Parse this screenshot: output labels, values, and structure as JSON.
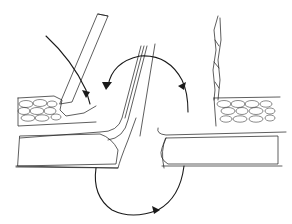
{
  "figure": {
    "type": "anatomical line illustration",
    "colors": {
      "background": "#ffffff",
      "ink": "#1a1a1a",
      "hatch": "#6a6a6a"
    },
    "elements": [
      {
        "name": "left-elevated-flap",
        "description": "diagonal textured flap rising from left tissue"
      },
      {
        "name": "right-vertical-flap",
        "description": "thin vertical flap on right side"
      },
      {
        "name": "left-upper-layer",
        "description": "cobblestone cell layer, left"
      },
      {
        "name": "right-upper-layer",
        "description": "cobblestone cell layer, right"
      },
      {
        "name": "left-lower-layer",
        "description": "hatched muscle layer, left"
      },
      {
        "name": "right-lower-layer",
        "description": "hatched muscle layer, right"
      },
      {
        "name": "central-cleft",
        "description": "angled parallel lines forming central gap"
      }
    ],
    "arrows": [
      {
        "name": "straight-curved-arrow-left",
        "direction": "downward into left flap"
      },
      {
        "name": "top-arc-arrow",
        "direction": "counter-clockwise over central cleft"
      },
      {
        "name": "bottom-arc-arrow",
        "direction": "clockwise beneath layers"
      }
    ]
  }
}
